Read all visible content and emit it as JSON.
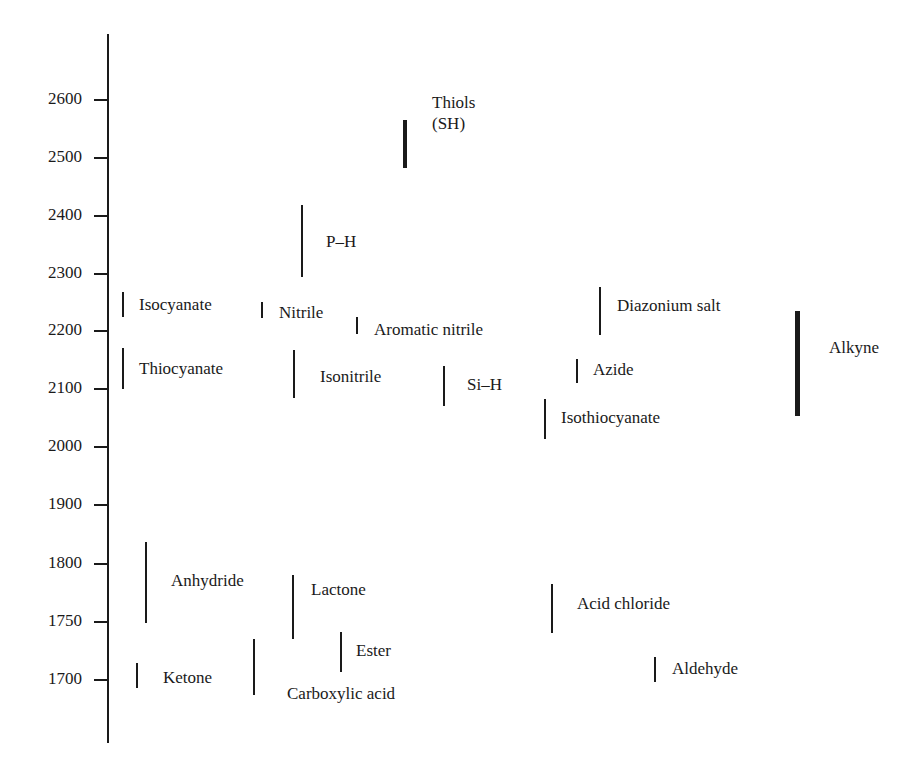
{
  "chart_data": {
    "type": "range-bar",
    "title": "",
    "xlabel": "",
    "ylabel": "",
    "axis": {
      "ticks": [
        2600,
        2500,
        2400,
        2300,
        2200,
        2100,
        2000,
        1900,
        1800,
        1750,
        1700
      ],
      "tick_labels": [
        "2600",
        "2500",
        "2400",
        "2300",
        "2200",
        "2100",
        "2000",
        "1900",
        "1800",
        "1750",
        "1700"
      ],
      "ylim": [
        1650,
        2700
      ],
      "note": "non-linear scale: 100 units per step above 1800, 50 units per step below 1800"
    },
    "grid": false,
    "legend": null,
    "series": [
      {
        "name": "Thiols (SH)",
        "range": [
          2550,
          2620
        ],
        "thick": true
      },
      {
        "name": "P–H",
        "range": [
          2280,
          2440
        ]
      },
      {
        "name": "Isocyanate",
        "range": [
          2230,
          2270
        ]
      },
      {
        "name": "Nitrile",
        "range": [
          2220,
          2250
        ]
      },
      {
        "name": "Aromatic nitrile",
        "range": [
          2200,
          2230
        ]
      },
      {
        "name": "Thiocyanate",
        "range": [
          2100,
          2170
        ]
      },
      {
        "name": "Isonitrile",
        "range": [
          2080,
          2170
        ]
      },
      {
        "name": "Si–H",
        "range": [
          2070,
          2140
        ]
      },
      {
        "name": "Diazonium salt",
        "range": [
          2200,
          2280
        ]
      },
      {
        "name": "Azide",
        "range": [
          2120,
          2160
        ]
      },
      {
        "name": "Isothiocyanate",
        "range": [
          2010,
          2080
        ]
      },
      {
        "name": "Alkyne",
        "range": [
          2050,
          2230
        ],
        "thick": true
      },
      {
        "name": "Anhydride",
        "range": [
          1750,
          1820
        ]
      },
      {
        "name": "Lactone",
        "range": [
          1735,
          1790
        ]
      },
      {
        "name": "Acid chloride",
        "range": [
          1740,
          1780
        ]
      },
      {
        "name": "Ester",
        "range": [
          1710,
          1740
        ]
      },
      {
        "name": "Ketone",
        "range": [
          1690,
          1715
        ]
      },
      {
        "name": "Carboxylic acid",
        "range": [
          1680,
          1735
        ]
      },
      {
        "name": "Aldehyde",
        "range": [
          1700,
          1720
        ]
      }
    ]
  },
  "axis": {
    "ticks": [
      {
        "label": "2600",
        "y": 99
      },
      {
        "label": "2500",
        "y": 157
      },
      {
        "label": "2400",
        "y": 215
      },
      {
        "label": "2300",
        "y": 273
      },
      {
        "label": "2200",
        "y": 330
      },
      {
        "label": "2100",
        "y": 388
      },
      {
        "label": "2000",
        "y": 446
      },
      {
        "label": "1900",
        "y": 504
      },
      {
        "label": "1800",
        "y": 563
      },
      {
        "label": "1750",
        "y": 621
      },
      {
        "label": "1700",
        "y": 679
      }
    ]
  },
  "bars": [
    {
      "label": "Thiols\n(SH)",
      "x": 405,
      "top": 120,
      "bottom": 168,
      "w": 4,
      "lx": 432,
      "ly": 92
    },
    {
      "label": "P–H",
      "x": 302,
      "top": 205,
      "bottom": 277,
      "w": 2,
      "lx": 326,
      "ly": 231
    },
    {
      "label": "Isocyanate",
      "x": 123,
      "top": 292,
      "bottom": 317,
      "w": 1.5,
      "lx": 139,
      "ly": 294
    },
    {
      "label": "Nitrile",
      "x": 262,
      "top": 302,
      "bottom": 318,
      "w": 2.5,
      "lx": 279,
      "ly": 302
    },
    {
      "label": "Aromatic nitrile",
      "x": 357,
      "top": 317,
      "bottom": 334,
      "w": 2,
      "lx": 374,
      "ly": 319
    },
    {
      "label": "Thiocyanate",
      "x": 123,
      "top": 348,
      "bottom": 389,
      "w": 1.5,
      "lx": 139,
      "ly": 358
    },
    {
      "label": "Isonitrile",
      "x": 294,
      "top": 350,
      "bottom": 398,
      "w": 2.5,
      "lx": 320,
      "ly": 366
    },
    {
      "label": "Si–H",
      "x": 444,
      "top": 366,
      "bottom": 406,
      "w": 2,
      "lx": 467,
      "ly": 374
    },
    {
      "label": "Diazonium salt",
      "x": 600,
      "top": 287,
      "bottom": 335,
      "w": 2,
      "lx": 617,
      "ly": 295
    },
    {
      "label": "Azide",
      "x": 577,
      "top": 359,
      "bottom": 383,
      "w": 2,
      "lx": 593,
      "ly": 359
    },
    {
      "label": "Isothiocyanate",
      "x": 545,
      "top": 399,
      "bottom": 439,
      "w": 2,
      "lx": 561,
      "ly": 407
    },
    {
      "label": "Alkyne",
      "x": 797,
      "top": 311,
      "bottom": 416,
      "w": 5,
      "lx": 829,
      "ly": 337
    },
    {
      "label": "Anhydride",
      "x": 146,
      "top": 542,
      "bottom": 623,
      "w": 2,
      "lx": 171,
      "ly": 570
    },
    {
      "label": "Lactone",
      "x": 293,
      "top": 575,
      "bottom": 639,
      "w": 2.5,
      "lx": 311,
      "ly": 579
    },
    {
      "label": "Acid chloride",
      "x": 552,
      "top": 584,
      "bottom": 633,
      "w": 2.5,
      "lx": 577,
      "ly": 593
    },
    {
      "label": "Ester",
      "x": 341,
      "top": 632,
      "bottom": 672,
      "w": 2,
      "lx": 356,
      "ly": 640
    },
    {
      "label": "Ketone",
      "x": 137,
      "top": 663,
      "bottom": 688,
      "w": 2,
      "lx": 163,
      "ly": 667
    },
    {
      "label": "Carboxylic acid",
      "x": 254,
      "top": 639,
      "bottom": 695,
      "w": 2.5,
      "lx": 287,
      "ly": 683
    },
    {
      "label": "Aldehyde",
      "x": 655,
      "top": 657,
      "bottom": 682,
      "w": 2,
      "lx": 672,
      "ly": 658
    }
  ]
}
